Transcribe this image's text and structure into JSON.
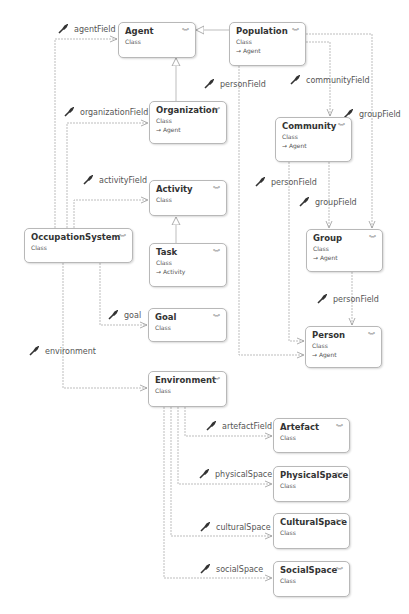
{
  "classes": {
    "agent": {
      "name": "Agent",
      "kind": "Class"
    },
    "population": {
      "name": "Population",
      "kind": "Class",
      "base": "→ Agent"
    },
    "organization": {
      "name": "Organization",
      "kind": "Class",
      "base": "→ Agent"
    },
    "community": {
      "name": "Community",
      "kind": "Class",
      "base": "→ Agent"
    },
    "activity": {
      "name": "Activity",
      "kind": "Class"
    },
    "occupation_system": {
      "name": "OccupationSystem",
      "kind": "Class"
    },
    "task": {
      "name": "Task",
      "kind": "Class",
      "base": "→ Activity"
    },
    "group": {
      "name": "Group",
      "kind": "Class",
      "base": "→ Agent"
    },
    "goal": {
      "name": "Goal",
      "kind": "Class"
    },
    "person": {
      "name": "Person",
      "kind": "Class",
      "base": "→ Agent"
    },
    "environment": {
      "name": "Environment",
      "kind": "Class"
    },
    "artefact": {
      "name": "Artefact",
      "kind": "Class"
    },
    "physical_space": {
      "name": "PhysicalSpace",
      "kind": "Class"
    },
    "cultural_space": {
      "name": "CulturalSpace",
      "kind": "Class"
    },
    "social_space": {
      "name": "SocialSpace",
      "kind": "Class"
    }
  },
  "associations": {
    "agent_field": "agentField",
    "organization_field": "organizationField",
    "activity_field": "activityField",
    "goal": "goal",
    "environment": "environment",
    "person_field_population": "personField",
    "community_field": "communityField",
    "group_field_population": "groupField",
    "person_field_community": "personField",
    "group_field_community": "groupField",
    "person_field_group": "personField",
    "artefact_field": "artefactField",
    "physical_space": "physicalSpace",
    "cultural_space": "culturalSpace",
    "social_space": "socialSpace"
  },
  "icons": {
    "collapse": "︾",
    "association": "wrench-icon"
  }
}
